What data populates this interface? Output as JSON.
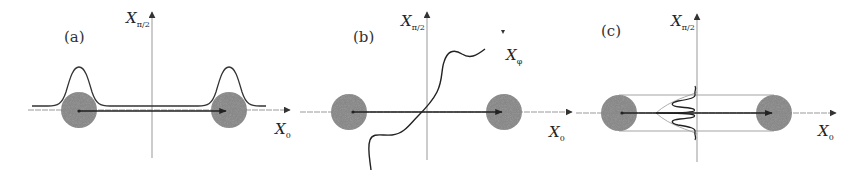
{
  "figure": {
    "panels": [
      {
        "id": "a",
        "label": "(a)",
        "y_axis_label": "X",
        "y_axis_subscript": "π/2",
        "x_axis_label": "X",
        "x_axis_subscript": "0",
        "description": "Two coherent-state disks on the X0 axis with Gaussian marginal distributions above each"
      },
      {
        "id": "b",
        "label": "(b)",
        "y_axis_label": "X",
        "y_axis_subscript": "π/2",
        "x_axis_label": "X",
        "x_axis_subscript": "0",
        "rotated_axis_label": "X",
        "rotated_axis_subscript": "φ",
        "description": "Two coherent-state disks with a wavy curve passing through the origin along a rotated quadrature X_phi"
      },
      {
        "id": "c",
        "label": "(c)",
        "y_axis_label": "X",
        "y_axis_subscript": "π/2",
        "x_axis_label": "X",
        "x_axis_subscript": "0",
        "description": "Two coherent-state disks joined by horizontal lines with interference fringes along the X_pi/2 axis"
      }
    ],
    "colors": {
      "disk": "#8a8a8a",
      "line": "#2a2a2a",
      "axis": "#888888",
      "background": "#ffffff"
    }
  }
}
